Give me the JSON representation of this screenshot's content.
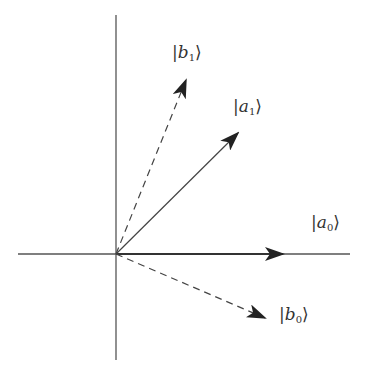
{
  "diagram": {
    "type": "vector-basis-diagram",
    "origin": [
      116,
      254
    ],
    "axes": {
      "horizontal": {
        "x1": 18,
        "x2": 350,
        "y": 254
      },
      "vertical": {
        "x": 116,
        "y1": 15,
        "y2": 360
      }
    },
    "colors": {
      "line": "#444444",
      "arrowhead": "#222222",
      "text": "#333333"
    },
    "vectors": [
      {
        "id": "a0",
        "style": "solid",
        "tip": [
          283,
          254
        ],
        "label_base": "a",
        "label_sub": "0"
      },
      {
        "id": "a1",
        "style": "solid",
        "tip": [
          238,
          133
        ],
        "label_base": "a",
        "label_sub": "1"
      },
      {
        "id": "b0",
        "style": "dashed",
        "tip": [
          265,
          318
        ],
        "label_base": "b",
        "label_sub": "0"
      },
      {
        "id": "b1",
        "style": "dashed",
        "tip": [
          186,
          80
        ],
        "label_base": "b",
        "label_sub": "1"
      }
    ],
    "labels": {
      "a0": {
        "bar": "|",
        "base": "a",
        "sub": "0",
        "rang": "⟩"
      },
      "a1": {
        "bar": "|",
        "base": "a",
        "sub": "1",
        "rang": "⟩"
      },
      "b0": {
        "bar": "|",
        "base": "b",
        "sub": "0",
        "rang": "⟩"
      },
      "b1": {
        "bar": "|",
        "base": "b",
        "sub": "1",
        "rang": "⟩"
      }
    }
  }
}
